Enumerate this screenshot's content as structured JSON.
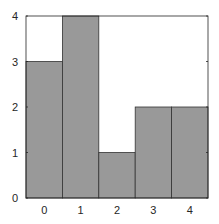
{
  "chart_data": {
    "type": "bar",
    "title": "",
    "xlabel": "",
    "ylabel": "",
    "categories": [
      "0",
      "1",
      "2",
      "3",
      "4"
    ],
    "values": [
      3,
      4,
      1,
      2,
      2
    ],
    "ylim": [
      0,
      4
    ],
    "yticks": [
      "0",
      "1",
      "2",
      "3",
      "4"
    ],
    "xticks": [
      "0",
      "1",
      "2",
      "3",
      "4"
    ],
    "grid": false,
    "legend": null,
    "bar_color": "#999999",
    "edge_color": "#333333"
  }
}
